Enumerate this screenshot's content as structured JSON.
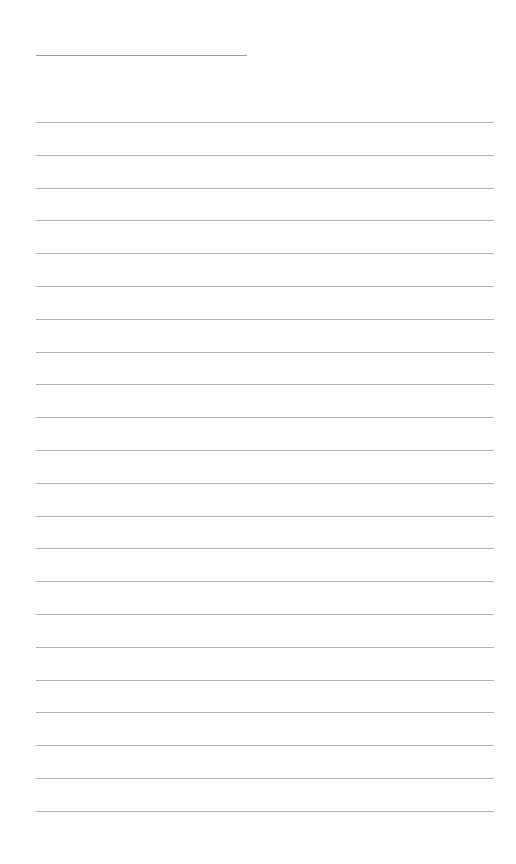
{
  "page": {
    "type": "lined-paper",
    "background_color": "#fefefe",
    "line_color": "#b4b4b4",
    "header_line": {
      "x": 36,
      "y": 55,
      "width": 211
    },
    "rules": {
      "count": 22,
      "x": 36,
      "width": 458,
      "first_y": 122,
      "spacing": 32.8
    }
  }
}
